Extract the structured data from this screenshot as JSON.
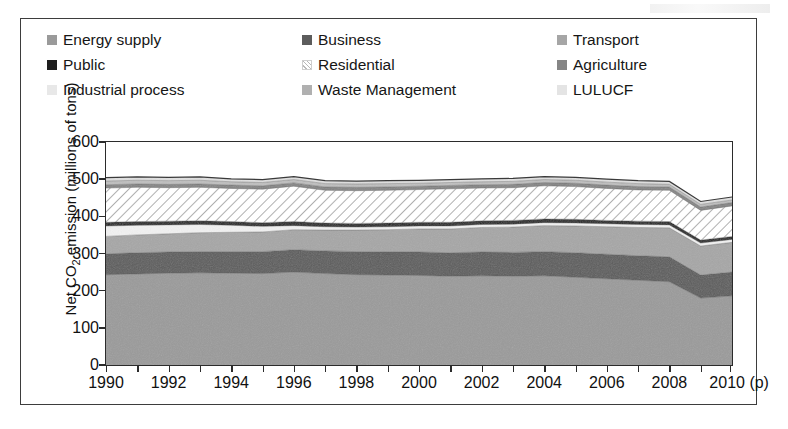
{
  "chart_data": {
    "type": "area",
    "title": "",
    "xlabel": "",
    "ylabel": "Net CO2 emission (millions of tons)",
    "ylabel_html": "Net CO<sub>2</sub> emission (millions of tons)",
    "grid": false,
    "legend_position": "top",
    "stacked": true,
    "xlim": [
      1990,
      2010
    ],
    "ylim": [
      0,
      600
    ],
    "ytick_labels": [
      "0",
      "100",
      "200",
      "300",
      "400",
      "500",
      "600"
    ],
    "yticks": [
      0,
      100,
      200,
      300,
      400,
      500,
      600
    ],
    "x": [
      1990,
      1991,
      1992,
      1993,
      1994,
      1995,
      1996,
      1997,
      1998,
      1999,
      2000,
      2001,
      2002,
      2003,
      2004,
      2005,
      2006,
      2007,
      2008,
      2009,
      2010
    ],
    "xtick_labels": [
      "1990",
      "1992",
      "1994",
      "1996",
      "1998",
      "2000",
      "2002",
      "2004",
      "2006",
      "2008",
      "2010 (p)"
    ],
    "xticks": [
      1990,
      1992,
      1994,
      1996,
      1998,
      2000,
      2002,
      2004,
      2006,
      2008,
      2010
    ],
    "series": [
      {
        "name": "Energy supply",
        "color": "#9a9a9a",
        "pattern": "solid",
        "values": [
          243,
          245,
          247,
          248,
          247,
          246,
          250,
          246,
          243,
          242,
          241,
          239,
          240,
          239,
          240,
          236,
          232,
          228,
          224,
          180,
          186
        ]
      },
      {
        "name": "Business",
        "color": "#5c5c5c",
        "pattern": "solid",
        "values": [
          56,
          57,
          57,
          57,
          58,
          59,
          60,
          61,
          62,
          62,
          63,
          63,
          64,
          64,
          65,
          66,
          66,
          66,
          67,
          62,
          64
        ]
      },
      {
        "name": "Transport",
        "color": "#a6a6a6",
        "pattern": "solid",
        "values": [
          47,
          48,
          49,
          51,
          52,
          53,
          54,
          56,
          58,
          60,
          62,
          64,
          66,
          68,
          70,
          72,
          74,
          76,
          78,
          78,
          80
        ]
      },
      {
        "name": "Industrial process",
        "color": "#f2f2f2",
        "pattern": "solid",
        "values": [
          28,
          26,
          24,
          22,
          19,
          15,
          11,
          9,
          8,
          8,
          8,
          8,
          8,
          8,
          8,
          8,
          8,
          8,
          8,
          8,
          8
        ]
      },
      {
        "name": "Public",
        "color": "#1e1e1e",
        "pattern": "solid",
        "values": [
          10,
          10,
          10,
          10,
          10,
          10,
          11,
          10,
          10,
          10,
          10,
          10,
          10,
          10,
          10,
          10,
          9,
          9,
          9,
          8,
          8
        ]
      },
      {
        "name": "Residential",
        "color": "#ffffff",
        "pattern": "hatch",
        "values": [
          92,
          92,
          90,
          90,
          89,
          90,
          95,
          88,
          88,
          88,
          88,
          90,
          88,
          88,
          89,
          88,
          86,
          84,
          84,
          80,
          82
        ]
      },
      {
        "name": "Agriculture",
        "color": "#858585",
        "pattern": "solid",
        "values": [
          9,
          9,
          9,
          9,
          9,
          9,
          9,
          9,
          9,
          9,
          9,
          9,
          9,
          9,
          9,
          9,
          9,
          9,
          9,
          9,
          9
        ]
      },
      {
        "name": "Waste Management",
        "color": "#bfbfbf",
        "pattern": "solid",
        "values": [
          10,
          10,
          10,
          10,
          9,
          9,
          9,
          9,
          9,
          9,
          8,
          8,
          8,
          8,
          8,
          8,
          8,
          8,
          7,
          7,
          7
        ]
      },
      {
        "name": "LULUCF",
        "color": "#e0e0e0",
        "pattern": "solid",
        "values": [
          9,
          9,
          9,
          9,
          8,
          8,
          8,
          8,
          8,
          8,
          8,
          8,
          8,
          8,
          8,
          8,
          8,
          8,
          8,
          8,
          8
        ]
      }
    ],
    "totals": [
      504,
      506,
      505,
      506,
      501,
      499,
      507,
      496,
      495,
      496,
      497,
      499,
      501,
      502,
      507,
      505,
      500,
      496,
      494,
      440,
      452
    ]
  },
  "legend": {
    "entries": [
      {
        "label": "Energy supply",
        "color": "#9a9a9a",
        "pattern": "solid"
      },
      {
        "label": "Business",
        "color": "#5c5c5c",
        "pattern": "solid"
      },
      {
        "label": "Transport",
        "color": "#a6a6a6",
        "pattern": "solid"
      },
      {
        "label": "Public",
        "color": "#1e1e1e",
        "pattern": "solid"
      },
      {
        "label": "Residential",
        "color": "#ffffff",
        "pattern": "hatch"
      },
      {
        "label": "Agriculture",
        "color": "#858585",
        "pattern": "solid"
      },
      {
        "label": "Industrial process",
        "color": "#e8e8e8",
        "pattern": "solid"
      },
      {
        "label": "Waste Management",
        "color": "#b0b0b0",
        "pattern": "solid"
      },
      {
        "label": "LULUCF",
        "color": "#e4e4e4",
        "pattern": "solid"
      }
    ]
  },
  "colors": {
    "frame": "#3d3d3d",
    "axis": "#2b2b2b",
    "text": "#111111",
    "background": "#ffffff"
  }
}
